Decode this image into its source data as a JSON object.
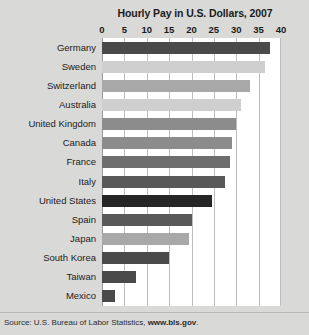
{
  "ghost_text": "",
  "figure": {
    "title": "Hourly Pay in U.S. Dollars, 2007",
    "source_prefix": "Source: U.S. Bureau of Labor Statistics, ",
    "source_link": "www.bls.gov",
    "source_suffix": "."
  },
  "colors": {
    "page_background": "#d9d9d7",
    "plot_background": "#ffffff",
    "gridline": "#bdbdbd",
    "text": "#1b1b1b",
    "bar_darkest": "#262626",
    "bar_dark": "#4a4a4a",
    "bar_medium_dark": "#595959",
    "bar_medium": "#6e6e6e",
    "bar_mid_gray": "#8c8c8c",
    "bar_light_gray": "#a8a8a8",
    "bar_lightest": "#cfcfcf"
  },
  "chart_data": {
    "type": "bar",
    "orientation": "horizontal",
    "title": "Hourly Pay in U.S. Dollars, 2007",
    "xlabel": "",
    "ylabel": "",
    "xlim": [
      0,
      40
    ],
    "xticks": [
      0,
      5,
      10,
      15,
      20,
      25,
      30,
      35,
      40
    ],
    "xtick_labels": [
      "0",
      "5",
      "10",
      "15",
      "20",
      "25",
      "30",
      "35",
      "40"
    ],
    "grid": true,
    "legend": false,
    "categories": [
      "Germany",
      "Sweden",
      "Switzerland",
      "Australia",
      "United Kingdom",
      "Canada",
      "France",
      "Italy",
      "United States",
      "Spain",
      "Japan",
      "South Korea",
      "Taiwan",
      "Mexico"
    ],
    "values": [
      37.5,
      36.5,
      33,
      31,
      30,
      29,
      28.5,
      27.5,
      24.5,
      20,
      19.5,
      15,
      7.5,
      3
    ],
    "bar_colors": [
      "#4a4a4a",
      "#cfcfcf",
      "#a8a8a8",
      "#cfcfcf",
      "#8c8c8c",
      "#8c8c8c",
      "#6e6e6e",
      "#595959",
      "#262626",
      "#595959",
      "#a8a8a8",
      "#4a4a4a",
      "#4a4a4a",
      "#4a4a4a"
    ]
  }
}
